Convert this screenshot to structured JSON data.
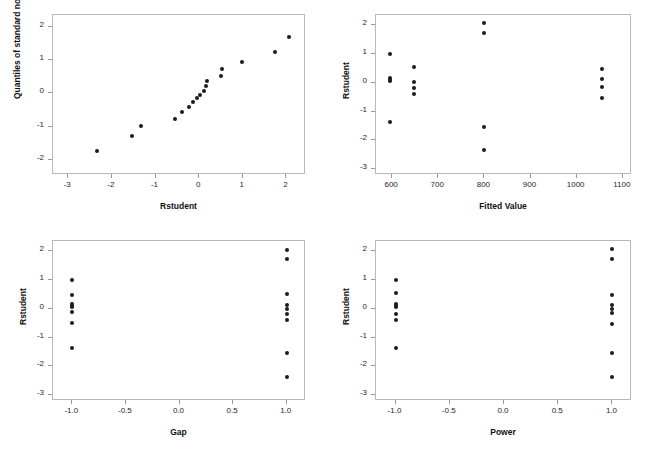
{
  "figure": {
    "background_color": "#ffffff",
    "point_color": "#1c1c1c",
    "frame_color": "#b8b8b8",
    "panel_count": 4
  },
  "chart_data": [
    {
      "type": "scatter",
      "title": "",
      "panel_name": "normal-quantile-plot",
      "xlabel": "Rstudent",
      "ylabel": "Quantiles of standard normal",
      "xlim": [
        -3.35,
        2.45
      ],
      "ylim": [
        -2.45,
        2.35
      ],
      "xticks": [
        -3,
        -2,
        -1,
        0,
        1,
        2
      ],
      "xticklabels": [
        "-3",
        "-2",
        "-1",
        "0",
        "1",
        "2"
      ],
      "yticks": [
        -2,
        -1,
        0,
        1,
        2
      ],
      "yticklabels": [
        "-2",
        "-1",
        "0",
        "1",
        "2"
      ],
      "grid": false,
      "legend": false,
      "x": [
        -2.34,
        -1.55,
        -1.34,
        -0.55,
        -0.39,
        -0.23,
        -0.14,
        -0.04,
        0.02,
        0.11,
        0.16,
        0.18,
        0.5,
        0.52,
        0.99,
        1.75,
        2.07
      ],
      "y": [
        -1.73,
        -1.27,
        -0.97,
        -0.77,
        -0.56,
        -0.4,
        -0.27,
        -0.13,
        -0.04,
        0.06,
        0.21,
        0.37,
        0.53,
        0.74,
        0.95,
        1.24,
        1.7
      ]
    },
    {
      "type": "scatter",
      "title": "",
      "panel_name": "rstudent-vs-fitted-value",
      "xlabel": "Fitted Value",
      "ylabel": "Rstudent",
      "xlim": [
        565,
        1120
      ],
      "ylim": [
        -3.2,
        2.35
      ],
      "xticks": [
        600,
        700,
        800,
        900,
        1000,
        1100
      ],
      "xticklabels": [
        "600",
        "700",
        "800",
        "900",
        "1000",
        "1100"
      ],
      "yticks": [
        -3,
        -2,
        -1,
        0,
        1,
        2
      ],
      "yticklabels": [
        "-3",
        "-2",
        "-1",
        "0",
        "1",
        "2"
      ],
      "grid": false,
      "legend": false,
      "x": [
        595,
        595,
        595,
        595,
        595,
        648,
        648,
        648,
        648,
        800,
        800,
        800,
        800,
        1055,
        1055,
        1055,
        1055
      ],
      "y": [
        1.0,
        0.16,
        0.11,
        0.06,
        -1.35,
        0.53,
        0.04,
        -0.19,
        -0.38,
        2.07,
        1.74,
        -1.52,
        -2.34,
        0.46,
        0.13,
        -0.15,
        -0.54
      ]
    },
    {
      "type": "scatter",
      "title": "",
      "panel_name": "rstudent-vs-gap",
      "xlabel": "Gap",
      "ylabel": "Rstudent",
      "xlim": [
        -1.18,
        1.18
      ],
      "ylim": [
        -3.2,
        2.35
      ],
      "xticks": [
        -1.0,
        -0.5,
        0.0,
        0.5,
        1.0
      ],
      "xticklabels": [
        "-1.0",
        "-0.5",
        "0.0",
        "0.5",
        "1.0"
      ],
      "yticks": [
        -3,
        -2,
        -1,
        0,
        1,
        2
      ],
      "yticklabels": [
        "-3",
        "-2",
        "-1",
        "0",
        "1",
        "2"
      ],
      "grid": false,
      "legend": false,
      "x": [
        -1.0,
        -1.0,
        -1.0,
        -1.0,
        -1.0,
        -1.0,
        -1.0,
        -1.0,
        1.0,
        1.0,
        1.0,
        1.0,
        1.0,
        1.0,
        1.0,
        1.0,
        1.0
      ],
      "y": [
        1.0,
        0.49,
        0.16,
        0.11,
        -0.13,
        -0.51,
        -1.35,
        0.06,
        2.04,
        1.71,
        0.52,
        0.0,
        -0.19,
        -0.39,
        -1.52,
        -2.36,
        0.13
      ]
    },
    {
      "type": "scatter",
      "title": "",
      "panel_name": "rstudent-vs-power",
      "xlabel": "Power",
      "ylabel": "Rstudent",
      "xlim": [
        -1.18,
        1.18
      ],
      "ylim": [
        -3.2,
        2.35
      ],
      "xticks": [
        -1.0,
        -0.5,
        0.0,
        0.5,
        1.0
      ],
      "xticklabels": [
        "-1.0",
        "-0.5",
        "0.0",
        "0.5",
        "1.0"
      ],
      "yticks": [
        -3,
        -2,
        -1,
        0,
        1,
        2
      ],
      "yticklabels": [
        "-3",
        "-2",
        "-1",
        "0",
        "1",
        "2"
      ],
      "grid": false,
      "legend": false,
      "x": [
        -1.0,
        -1.0,
        -1.0,
        -1.0,
        -1.0,
        -1.0,
        -1.0,
        -1.0,
        1.0,
        1.0,
        1.0,
        1.0,
        1.0,
        1.0,
        1.0,
        1.0,
        1.0
      ],
      "y": [
        1.0,
        0.53,
        0.16,
        0.11,
        0.06,
        -0.19,
        -0.38,
        -1.35,
        2.07,
        1.74,
        0.46,
        0.13,
        -0.15,
        -0.54,
        -1.52,
        -2.36,
        0.0
      ]
    }
  ]
}
